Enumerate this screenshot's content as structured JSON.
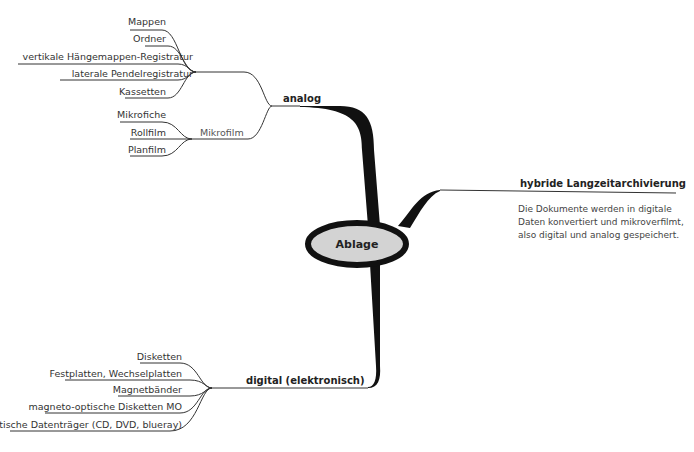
{
  "center": {
    "label": "Ablage",
    "fill": "#d3d3d3",
    "stroke": "#111111"
  },
  "branches": {
    "analog": {
      "label": "analog",
      "items": [
        "Mappen",
        "Ordner",
        "vertikale Hängemappen-Registratur",
        "laterale Pendelregistratur",
        "Kassetten"
      ],
      "mikrofilm": {
        "label": "Mikrofilm",
        "items": [
          "Mikrofiche",
          "Rollfilm",
          "Planfilm"
        ]
      }
    },
    "hybrid": {
      "label": "hybride Langzeitarchivierung",
      "description": [
        "Die Dokumente werden in digitale",
        "Daten konvertiert und mikroverfilmt,",
        "also digital und analog gespeichert."
      ]
    },
    "digital": {
      "label": "digital (elektronisch)",
      "items": [
        "Disketten",
        "Festplatten, Wechselplatten",
        "Magnetbänder",
        "magneto-optische Disketten MO",
        "optische Datenträger (CD, DVD, blueray)"
      ]
    }
  }
}
